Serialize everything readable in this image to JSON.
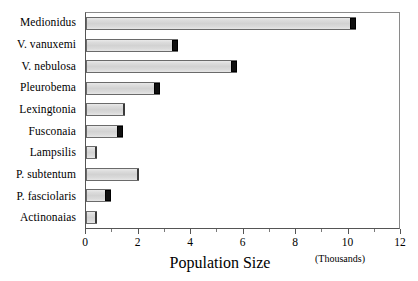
{
  "chart_data": {
    "type": "bar",
    "orientation": "horizontal",
    "title": "",
    "xlabel": "Population Size",
    "xlabel_units": "(Thousands)",
    "ylabel": "",
    "xlim": [
      0,
      12
    ],
    "xticks": [
      0,
      2,
      4,
      6,
      8,
      10,
      12
    ],
    "xtick_labels": [
      "0",
      "2",
      "4",
      "6",
      "8",
      "10",
      "12"
    ],
    "minor_xticks": [
      1,
      3,
      5,
      7,
      9,
      11
    ],
    "grid": false,
    "legend": false,
    "categories": [
      "Medionidus",
      "V. vanuxemi",
      "V. nebulosa",
      "Pleurobema",
      "Lexingtonia",
      "Fusconaia",
      "Lampsilis",
      "P. subtentum",
      "P. fasciolaris",
      "Actinonaias"
    ],
    "values": [
      10.3,
      3.5,
      5.75,
      2.8,
      1.5,
      1.4,
      0.4,
      2.0,
      0.95,
      0.4
    ],
    "bar_face_color": "#d6d6d6",
    "bar_edge_color": "#6a6a6a",
    "bar_cap_color": "#101010"
  },
  "bars": [
    {
      "label": "Medionidus",
      "value": 10.3,
      "cap": true
    },
    {
      "label": "V. vanuxemi",
      "value": 3.5,
      "cap": true
    },
    {
      "label": "V. nebulosa",
      "value": 5.75,
      "cap": true
    },
    {
      "label": "Pleurobema",
      "value": 2.8,
      "cap": true
    },
    {
      "label": "Lexingtonia",
      "value": 1.5,
      "cap": false
    },
    {
      "label": "Fusconaia",
      "value": 1.4,
      "cap": true
    },
    {
      "label": "Lampsilis",
      "value": 0.4,
      "cap": false
    },
    {
      "label": "P. subtentum",
      "value": 2.0,
      "cap": false
    },
    {
      "label": "P. fasciolaris",
      "value": 0.95,
      "cap": true
    },
    {
      "label": "Actinonaias",
      "value": 0.4,
      "cap": false
    }
  ],
  "axis": {
    "x_title": "Population Size",
    "units": "(Thousands)",
    "ticks": [
      "0",
      "2",
      "4",
      "6",
      "8",
      "10",
      "12"
    ]
  }
}
